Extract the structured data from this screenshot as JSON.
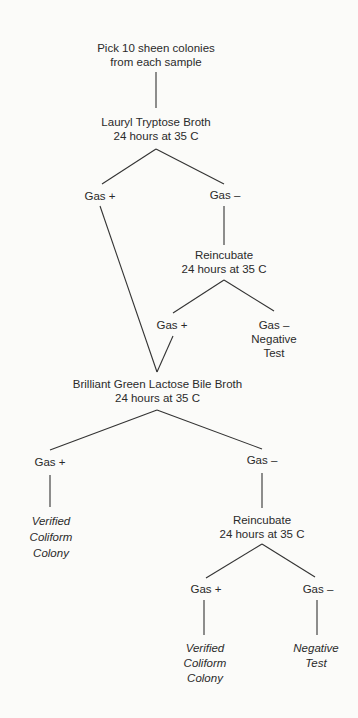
{
  "diagram": {
    "type": "flowchart",
    "nodes": {
      "start": {
        "line1": "Pick 10 sheen colonies",
        "line2": "from each sample"
      },
      "ltb": {
        "line1": "Lauryl Tryptose Broth",
        "line2": "24 hours at 35 C"
      },
      "ltb_pos": {
        "label": "Gas +"
      },
      "ltb_neg": {
        "label": "Gas –"
      },
      "reinc1": {
        "line1": "Reincubate",
        "line2": "24 hours at 35 C"
      },
      "reinc1_pos": {
        "label": "Gas +"
      },
      "reinc1_neg": {
        "line1": "Gas –",
        "line2": "Negative",
        "line3": "Test"
      },
      "bglb": {
        "line1": "Brilliant Green Lactose Bile Broth",
        "line2": "24 hours at 35 C"
      },
      "bglb_pos": {
        "label": "Gas +"
      },
      "bglb_neg": {
        "label": "Gas –"
      },
      "verified1": {
        "line1": "Verified",
        "line2": "Coliform",
        "line3": "Colony"
      },
      "reinc2": {
        "line1": "Reincubate",
        "line2": "24 hours at 35 C"
      },
      "reinc2_pos": {
        "label": "Gas +"
      },
      "reinc2_neg": {
        "label": "Gas –"
      },
      "verified2": {
        "line1": "Verified",
        "line2": "Coliform",
        "line3": "Colony"
      },
      "negative2": {
        "line1": "Negative",
        "line2": "Test"
      }
    }
  }
}
